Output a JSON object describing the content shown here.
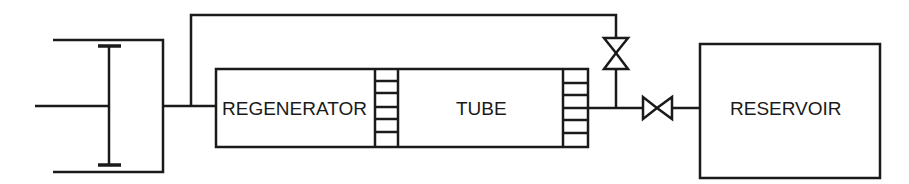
{
  "diagram": {
    "type": "pulse-tube-cryocooler-schematic",
    "labels": {
      "regenerator": "REGENERATOR",
      "tube": "TUBE",
      "reservoir": "RESERVOIR"
    },
    "components": [
      "piston-compressor",
      "regenerator",
      "heat-exchanger-cold",
      "tube",
      "heat-exchanger-warm",
      "bypass-valve",
      "orifice-valve",
      "reservoir"
    ],
    "colors": {
      "stroke": "#1a1a1a",
      "background": "#ffffff"
    }
  }
}
